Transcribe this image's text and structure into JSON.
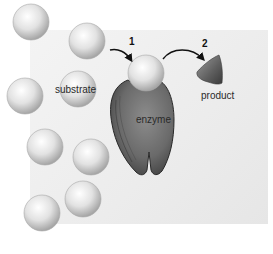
{
  "diagram": {
    "labels": {
      "substrate": "substrate",
      "enzyme": "enzyme",
      "product": "product"
    },
    "steps": [
      {
        "number": "1",
        "description": "substrate binds enzyme"
      },
      {
        "number": "2",
        "description": "product released"
      }
    ],
    "substrate_spheres": [
      {
        "cx": 31,
        "cy": 22
      },
      {
        "cx": 87,
        "cy": 41
      },
      {
        "cx": 25,
        "cy": 96
      },
      {
        "cx": 78,
        "cy": 89
      },
      {
        "cx": 45,
        "cy": 147
      },
      {
        "cx": 91,
        "cy": 157
      },
      {
        "cx": 42,
        "cy": 213
      },
      {
        "cx": 83,
        "cy": 199
      }
    ],
    "bound_sphere": {
      "cx": 146,
      "cy": 73
    },
    "colors": {
      "sphere_light": "#ffffff",
      "sphere_mid": "#dcdcdc",
      "sphere_dark": "#9a9a9a",
      "enzyme_fill": "#6f6f6f",
      "enzyme_dark": "#3a3a3a",
      "product_fill": "#6a6a6a",
      "arrow": "#111111"
    }
  }
}
